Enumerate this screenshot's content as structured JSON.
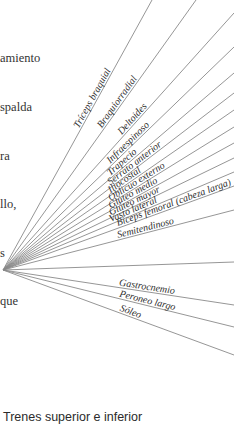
{
  "body_text": {
    "lines": [
      "amiento",
      "spalda",
      "ra",
      "llo,",
      "s",
      "que"
    ]
  },
  "diagram": {
    "origin": [
      3,
      270
    ],
    "line_color": "#8a8a8a",
    "labels": [
      {
        "text": "Tríceps braquial",
        "end": [
          152,
          0
        ]
      },
      {
        "text": "Braquiorradial",
        "end": [
          196,
          0
        ]
      },
      {
        "text": "Deltoides",
        "end": [
          234,
          13
        ]
      },
      {
        "text": "Infraespinoso",
        "end": [
          234,
          47
        ]
      },
      {
        "text": "Trapecio",
        "end": [
          234,
          73
        ]
      },
      {
        "text": "Serrato anterior",
        "end": [
          234,
          93
        ]
      },
      {
        "text": "Iliocostal",
        "end": [
          234,
          110
        ]
      },
      {
        "text": "Oblicuo externo",
        "end": [
          234,
          127
        ]
      },
      {
        "text": "Glúteo medio",
        "end": [
          234,
          143
        ]
      },
      {
        "text": "Glúteo mayor",
        "end": [
          234,
          158
        ]
      },
      {
        "text": "Vasto lateral",
        "end": [
          234,
          172
        ]
      },
      {
        "text": "Bíceps femoral (cabeza larga)",
        "end": [
          234,
          186
        ]
      },
      {
        "text": "Semitendinoso",
        "end": [
          234,
          210
        ]
      },
      {
        "text": "",
        "end": [
          234,
          262
        ]
      },
      {
        "text": "Gastrocnemio",
        "end": [
          234,
          305
        ]
      },
      {
        "text": "Peroneo largo",
        "end": [
          234,
          327
        ]
      },
      {
        "text": "Sóleo",
        "end": [
          234,
          355
        ]
      }
    ]
  },
  "caption": "Trenes superior e inferior"
}
